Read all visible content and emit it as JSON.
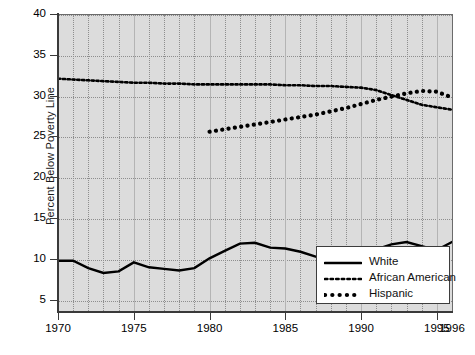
{
  "chart_data": {
    "type": "line",
    "title": "",
    "subtitle": "",
    "xlabel": "",
    "ylabel": "Percent Below Poverty Line",
    "xlim": [
      1970,
      1996
    ],
    "ylim": [
      3.5,
      40
    ],
    "grid": true,
    "legend_position": "bottom-right",
    "yticks": [
      40,
      35,
      30,
      25,
      20,
      15,
      10,
      5
    ],
    "xticks": [
      1970,
      1975,
      1980,
      1985,
      1990,
      1995,
      1996
    ],
    "xtick_labels": [
      "1970",
      "1975",
      "1980",
      "1985",
      "1990",
      "1995",
      "1996"
    ],
    "background_color": "#dcdcdc",
    "series": [
      {
        "name": "White",
        "style": "solid",
        "color": "#000000",
        "x": [
          1970,
          1971,
          1972,
          1973,
          1974,
          1975,
          1976,
          1977,
          1978,
          1979,
          1980,
          1981,
          1982,
          1983,
          1984,
          1985,
          1986,
          1987,
          1988,
          1989,
          1990,
          1991,
          1992,
          1993,
          1994,
          1995,
          1996
        ],
        "values": [
          9.9,
          9.9,
          9.0,
          8.4,
          8.6,
          9.7,
          9.1,
          8.9,
          8.7,
          9.0,
          10.2,
          11.1,
          12.0,
          12.1,
          11.5,
          11.4,
          11.0,
          10.4,
          10.1,
          10.0,
          10.7,
          11.3,
          11.9,
          12.2,
          11.7,
          11.2,
          12.2
        ]
      },
      {
        "name": "African American",
        "style": "dotted-fine",
        "color": "#000000",
        "x": [
          1970,
          1971,
          1972,
          1973,
          1974,
          1975,
          1976,
          1977,
          1978,
          1979,
          1980,
          1981,
          1982,
          1983,
          1984,
          1985,
          1986,
          1987,
          1988,
          1989,
          1990,
          1991,
          1992,
          1993,
          1994,
          1995,
          1996
        ],
        "values": [
          32.2,
          32.1,
          32.0,
          31.9,
          31.8,
          31.7,
          31.7,
          31.6,
          31.6,
          31.5,
          31.5,
          31.5,
          31.5,
          31.5,
          31.5,
          31.4,
          31.4,
          31.3,
          31.3,
          31.2,
          31.1,
          30.8,
          30.2,
          29.6,
          29.0,
          28.7,
          28.4
        ]
      },
      {
        "name": "Hispanic",
        "style": "dotted-bold",
        "color": "#000000",
        "x": [
          1980,
          1981,
          1982,
          1983,
          1984,
          1985,
          1986,
          1987,
          1988,
          1989,
          1990,
          1991,
          1992,
          1993,
          1994,
          1995,
          1996
        ],
        "values": [
          25.7,
          26.0,
          26.3,
          26.6,
          26.9,
          27.2,
          27.5,
          27.8,
          28.2,
          28.6,
          29.1,
          29.6,
          30.0,
          30.4,
          30.7,
          30.6,
          29.9
        ]
      }
    ]
  },
  "legend": {
    "items": [
      {
        "label": "White",
        "style": "solid"
      },
      {
        "label": "African American",
        "style": "dotted-fine"
      },
      {
        "label": "Hispanic",
        "style": "dotted-bold"
      }
    ]
  },
  "axes": {
    "y_title": "Percent Below Poverty Line"
  },
  "caption": ""
}
